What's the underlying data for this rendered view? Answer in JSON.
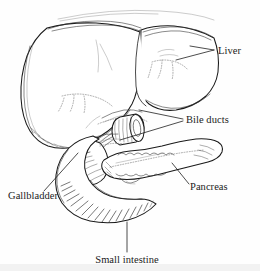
{
  "figure": {
    "background_color": "#fefefe",
    "ink_color": "#1a1a1a",
    "width": 260,
    "height": 271,
    "style": "black-and-white pen-and-ink anatomical line drawing"
  },
  "labels": [
    {
      "id": "liver",
      "text": "Liver",
      "x": 218,
      "y": 54,
      "anchor": "start",
      "leader": "M 214 50 L 190 46 M 214 50 L 176 60"
    },
    {
      "id": "bile-ducts",
      "text": "Bile ducts",
      "x": 186,
      "y": 123,
      "anchor": "start",
      "leader": "M 183 119 L 139 110 M 183 121 L 120 140"
    },
    {
      "id": "pancreas",
      "text": "Pancreas",
      "x": 190,
      "y": 190,
      "anchor": "start",
      "leader": "M 189 184 L 172 163"
    },
    {
      "id": "gallbladder",
      "text": "Gallbladder",
      "x": 8,
      "y": 199,
      "anchor": "start",
      "leader": "M 44 191 L 78 153"
    },
    {
      "id": "small-intestine",
      "text": "Small intestine",
      "x": 127,
      "y": 263,
      "anchor": "middle",
      "leader": "M 127 252 L 127 222"
    }
  ],
  "organs": [
    {
      "id": "liver-left-lobe",
      "name": "Liver left lobe"
    },
    {
      "id": "liver-right-lobe",
      "name": "Liver right lobe"
    },
    {
      "id": "diaphragm-arc",
      "name": "Diaphragm outline"
    },
    {
      "id": "gallbladder-body",
      "name": "Gallbladder"
    },
    {
      "id": "duodenum-loop",
      "name": "Duodenum / small intestine"
    },
    {
      "id": "pancreas-body",
      "name": "Pancreas"
    },
    {
      "id": "bile-duct-cylinder",
      "name": "Cut bile duct stump"
    }
  ]
}
